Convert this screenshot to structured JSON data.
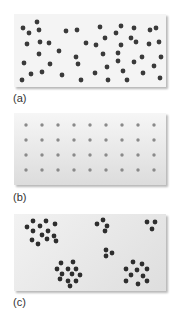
{
  "figure": {
    "panels": [
      {
        "id": "a",
        "label": "(a)",
        "pattern": "random",
        "background": "#f4f4f4",
        "dot_color": "#3a3a3a",
        "dot_radius": 2.4,
        "dots": [
          [
            37,
            22
          ],
          [
            23,
            28
          ],
          [
            39,
            30
          ],
          [
            66,
            31
          ],
          [
            77,
            30
          ],
          [
            29,
            33
          ],
          [
            100,
            27
          ],
          [
            121,
            26
          ],
          [
            116,
            33
          ],
          [
            134,
            28
          ],
          [
            150,
            30
          ],
          [
            156,
            28
          ],
          [
            131,
            38
          ],
          [
            105,
            38
          ],
          [
            27,
            44
          ],
          [
            40,
            42
          ],
          [
            49,
            43
          ],
          [
            86,
            43
          ],
          [
            96,
            45
          ],
          [
            136,
            42
          ],
          [
            149,
            44
          ],
          [
            159,
            42
          ],
          [
            59,
            51
          ],
          [
            121,
            45
          ],
          [
            39,
            54
          ],
          [
            76,
            57
          ],
          [
            103,
            54
          ],
          [
            118,
            53
          ],
          [
            118,
            61
          ],
          [
            142,
            57
          ],
          [
            161,
            57
          ],
          [
            24,
            63
          ],
          [
            50,
            64
          ],
          [
            78,
            64
          ],
          [
            134,
            62
          ],
          [
            107,
            67
          ],
          [
            154,
            66
          ],
          [
            31,
            74
          ],
          [
            42,
            72
          ],
          [
            62,
            75
          ],
          [
            95,
            73
          ],
          [
            123,
            71
          ],
          [
            143,
            73
          ],
          [
            22,
            80
          ],
          [
            81,
            80
          ],
          [
            108,
            80
          ],
          [
            127,
            80
          ],
          [
            160,
            78
          ]
        ]
      },
      {
        "id": "b",
        "label": "(b)",
        "pattern": "uniform",
        "background_top": "#f6f6f6",
        "background_bottom": "#dcdcdc",
        "dot_color": "#8a8a8a",
        "dot_radius": 1.7,
        "grid": {
          "columns": [
            26,
            42,
            58,
            74,
            90,
            106,
            122,
            138,
            154
          ],
          "rows": [
            125,
            140,
            155,
            170
          ]
        }
      },
      {
        "id": "c",
        "label": "(c)",
        "pattern": "clustered",
        "background": "#e9e9e9",
        "dot_color": "#2e2e2e",
        "dot_radius": 2.4,
        "dots": [
          [
            33,
            221
          ],
          [
            46,
            221
          ],
          [
            27,
            227
          ],
          [
            40,
            226
          ],
          [
            55,
            224
          ],
          [
            33,
            231
          ],
          [
            48,
            231
          ],
          [
            42,
            235
          ],
          [
            54,
            236
          ],
          [
            32,
            240
          ],
          [
            47,
            239
          ],
          [
            38,
            244
          ],
          [
            56,
            241
          ],
          [
            97,
            224
          ],
          [
            103,
            220
          ],
          [
            107,
            226
          ],
          [
            105,
            231
          ],
          [
            147,
            222
          ],
          [
            155,
            222
          ],
          [
            152,
            229
          ],
          [
            106,
            250
          ],
          [
            112,
            253
          ],
          [
            106,
            256
          ],
          [
            61,
            263
          ],
          [
            73,
            262
          ],
          [
            57,
            269
          ],
          [
            68,
            269
          ],
          [
            76,
            269
          ],
          [
            62,
            274
          ],
          [
            72,
            274
          ],
          [
            80,
            275
          ],
          [
            60,
            279
          ],
          [
            68,
            281
          ],
          [
            76,
            281
          ],
          [
            70,
            286
          ],
          [
            133,
            262
          ],
          [
            142,
            264
          ],
          [
            126,
            269
          ],
          [
            137,
            270
          ],
          [
            147,
            269
          ],
          [
            131,
            275
          ],
          [
            143,
            276
          ],
          [
            126,
            281
          ],
          [
            138,
            284
          ],
          [
            147,
            281
          ]
        ]
      }
    ]
  }
}
